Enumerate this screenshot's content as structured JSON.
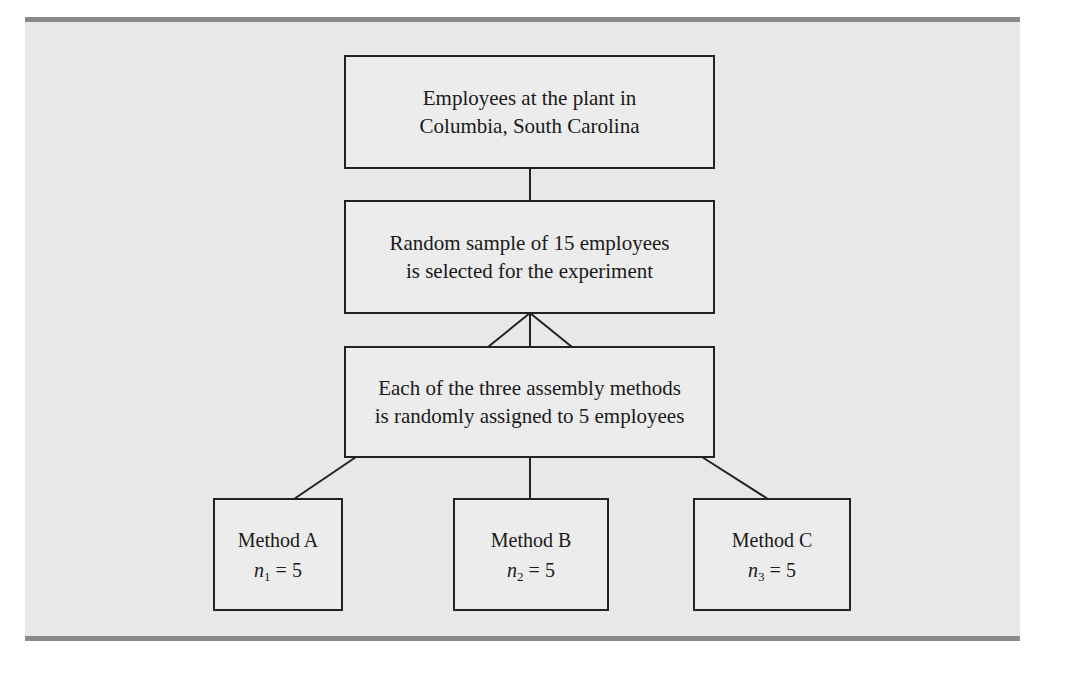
{
  "diagram": {
    "boxes": {
      "population": {
        "lines": [
          "Employees at the plant in",
          "Columbia, South Carolina"
        ]
      },
      "sample": {
        "lines": [
          "Random sample of 15 employees",
          "is selected for the experiment"
        ]
      },
      "assignment": {
        "lines": [
          "Each of the three assembly methods",
          "is randomly assigned to 5 employees"
        ]
      }
    },
    "methods": [
      {
        "label": "Method A",
        "var": "n",
        "sub": "1",
        "eq": " = 5"
      },
      {
        "label": "Method B",
        "var": "n",
        "sub": "2",
        "eq": " = 5"
      },
      {
        "label": "Method C",
        "var": "n",
        "sub": "3",
        "eq": " = 5"
      }
    ],
    "colors": {
      "panel": "#e8e8e8",
      "band": "#8a8a8a",
      "stroke": "#222222"
    }
  }
}
